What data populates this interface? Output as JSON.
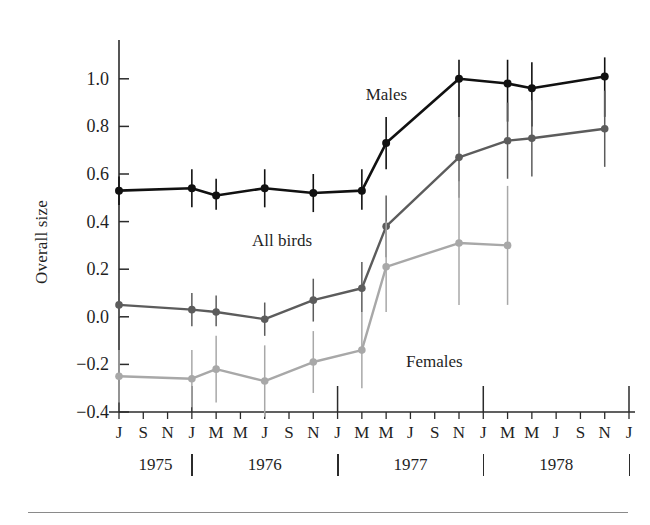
{
  "figure": {
    "ylabel": "Overall size",
    "bottom_rule": true
  },
  "chart_data": {
    "type": "line",
    "title": "",
    "xlabel": "",
    "ylabel": "Overall size",
    "ylim": [
      -0.4,
      1.1
    ],
    "yticks": [
      -0.4,
      -0.2,
      0.0,
      0.2,
      0.4,
      0.6,
      0.8,
      1.0
    ],
    "ytick_labels": [
      "−0.4",
      "−0.2",
      "0.0",
      "0.2",
      "0.4",
      "0.6",
      "0.8",
      "1.0"
    ],
    "grid": false,
    "legend": "inline-annotations",
    "x": [
      "1975-07",
      "1975-09",
      "1975-11",
      "1976-01",
      "1976-03",
      "1976-05",
      "1976-07",
      "1976-09",
      "1976-11",
      "1977-01",
      "1977-03",
      "1977-05",
      "1977-07",
      "1977-09",
      "1977-11",
      "1978-01",
      "1978-03",
      "1978-05",
      "1978-07",
      "1978-09",
      "1978-11",
      "1979-01"
    ],
    "xtick_labels": [
      "J",
      "S",
      "N",
      "J",
      "M",
      "M",
      "J",
      "S",
      "N",
      "J",
      "M",
      "M",
      "J",
      "S",
      "N",
      "J",
      "M",
      "M",
      "J",
      "S",
      "N",
      "J"
    ],
    "year_groups": [
      "1975",
      "1976",
      "1977",
      "1978"
    ],
    "series": [
      {
        "name": "Males",
        "color": "#111111",
        "values": [
          0.53,
          null,
          null,
          0.54,
          0.51,
          null,
          0.54,
          null,
          0.52,
          null,
          0.53,
          0.73,
          null,
          null,
          1.0,
          null,
          0.98,
          0.96,
          null,
          null,
          1.01,
          null
        ],
        "err_low": [
          0.47,
          null,
          null,
          0.46,
          0.45,
          null,
          0.46,
          null,
          0.44,
          null,
          0.45,
          0.62,
          null,
          null,
          0.84,
          null,
          0.82,
          0.8,
          null,
          null,
          0.84,
          null
        ],
        "err_high": [
          0.59,
          null,
          null,
          0.62,
          0.58,
          null,
          0.62,
          null,
          0.6,
          null,
          0.62,
          0.84,
          null,
          null,
          1.08,
          null,
          1.08,
          1.07,
          null,
          null,
          1.09,
          null
        ]
      },
      {
        "name": "All birds",
        "color": "#5c5c5c",
        "values": [
          0.05,
          null,
          null,
          0.03,
          0.02,
          null,
          -0.01,
          null,
          0.07,
          null,
          0.12,
          0.38,
          null,
          null,
          0.67,
          null,
          0.74,
          0.75,
          null,
          null,
          0.79,
          null
        ],
        "err_low": [
          0.0,
          null,
          null,
          -0.04,
          -0.04,
          null,
          -0.08,
          null,
          -0.02,
          null,
          0.02,
          0.25,
          null,
          null,
          0.5,
          null,
          0.58,
          0.59,
          null,
          null,
          0.63,
          null
        ],
        "err_high": [
          0.1,
          null,
          null,
          0.1,
          0.09,
          null,
          0.06,
          null,
          0.16,
          null,
          0.23,
          0.51,
          null,
          null,
          0.84,
          null,
          0.9,
          0.91,
          null,
          null,
          0.95,
          null
        ]
      },
      {
        "name": "Females",
        "color": "#a8a8a8",
        "values": [
          -0.25,
          null,
          null,
          -0.26,
          -0.22,
          null,
          -0.27,
          null,
          -0.19,
          null,
          -0.14,
          0.21,
          null,
          null,
          0.31,
          null,
          0.3,
          null,
          null,
          null,
          null,
          null
        ],
        "err_low": [
          -0.36,
          null,
          null,
          -0.38,
          -0.36,
          null,
          -0.42,
          null,
          -0.32,
          null,
          -0.3,
          0.02,
          null,
          null,
          0.05,
          null,
          0.05,
          null,
          null,
          null,
          null,
          null
        ],
        "err_high": [
          -0.14,
          null,
          null,
          -0.14,
          -0.08,
          null,
          -0.12,
          null,
          -0.06,
          null,
          0.02,
          0.4,
          null,
          null,
          0.57,
          null,
          0.55,
          null,
          null,
          null,
          null,
          null
        ]
      }
    ],
    "annotations": [
      {
        "text": "Males",
        "x": 11,
        "y": 0.93
      },
      {
        "text": "All birds",
        "x": 7,
        "y": 0.32
      },
      {
        "text": "Females",
        "x": 13,
        "y": -0.19
      }
    ]
  },
  "ytick_labels": [
    "1.0",
    "0.8",
    "0.6",
    "0.4",
    "0.2",
    "0.0",
    "−0.2",
    "−0.4"
  ],
  "xtick_labels": [
    "J",
    "S",
    "N",
    "J",
    "M",
    "M",
    "J",
    "S",
    "N",
    "J",
    "M",
    "M",
    "J",
    "S",
    "N",
    "J",
    "M",
    "M",
    "J",
    "S",
    "N",
    "J"
  ],
  "year_labels": [
    "1975",
    "1976",
    "1977",
    "1978"
  ],
  "series_labels": {
    "males": "Males",
    "all_birds": "All birds",
    "females": "Females"
  }
}
